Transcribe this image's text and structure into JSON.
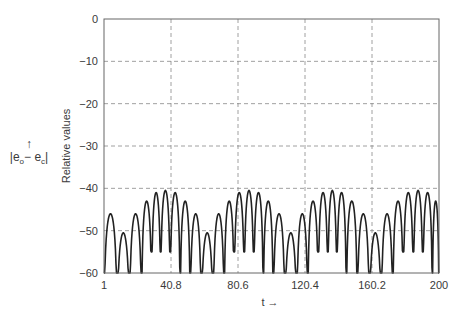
{
  "chart_data": {
    "type": "line",
    "title": "",
    "xlabel": "t →",
    "ylabel": "Relative values",
    "side_label": {
      "arrow": "↑",
      "expression": "|e_o − e_c|"
    },
    "xlim": [
      1,
      200
    ],
    "ylim": [
      -60,
      0
    ],
    "xticks": [
      1,
      40.8,
      80.6,
      120.4,
      160.2,
      200
    ],
    "xtick_labels": [
      "1",
      "40.8",
      "80.6",
      "120.4",
      "160.2",
      "200"
    ],
    "yticks": [
      0,
      -10,
      -20,
      -30,
      -40,
      -50,
      -60
    ],
    "ytick_labels": [
      "0",
      "−10",
      "−20",
      "−30",
      "−40",
      "−50",
      "−60"
    ],
    "grid": true,
    "grid_style": "dashed",
    "line_color": "#222222",
    "lobe_floor": -60,
    "series": [
      {
        "name": "|eo - ec|",
        "description": "Arch-shaped lobes (dB magnitude); peak t and peak value per lobe",
        "peaks_t": [
          5.2,
          12.3,
          20.1,
          26.6,
          32.0,
          37.3,
          43.3,
          49.2,
          55.2,
          62.3,
          69.4,
          75.4,
          81.3,
          87.3,
          92.6,
          98.6,
          104.5,
          112.3,
          118.8,
          125.3,
          131.3,
          136.6,
          142.0,
          147.9,
          155.0,
          162.2,
          169.3,
          175.8,
          181.8,
          187.7,
          193.1,
          199.0
        ],
        "peaks_value": [
          -46,
          -50.5,
          -46,
          -43,
          -41,
          -40.5,
          -41,
          -43,
          -46,
          -50.5,
          -46,
          -43,
          -41,
          -40.5,
          -41,
          -43,
          -46,
          -50.5,
          -46,
          -43,
          -41,
          -40.5,
          -41,
          -43,
          -46,
          -50.5,
          -46,
          -43,
          -41,
          -40.5,
          -41,
          -43
        ],
        "valleys_value": [
          -60,
          -60,
          -60,
          -60,
          -55,
          -55,
          -55,
          -60,
          -60,
          -60,
          -60,
          -60,
          -55,
          -55,
          -55,
          -60,
          -60,
          -60,
          -60,
          -60,
          -55,
          -55,
          -55,
          -60,
          -60,
          -60,
          -60,
          -60,
          -55,
          -55,
          -55,
          -60,
          -60
        ]
      }
    ]
  }
}
